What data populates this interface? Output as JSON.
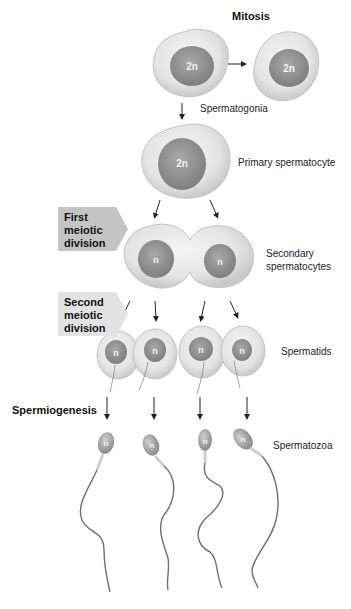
{
  "title": "Mitosis",
  "stages": {
    "spermatogonia": "Spermatogonia",
    "primary": "Primary spermatocyte",
    "secondary_line1": "Secondary",
    "secondary_line2": "spermatocytes",
    "spermatids": "Spermatids",
    "spermatozoa": "Spermatozoa"
  },
  "processes": {
    "first_meiotic": [
      "First",
      "meiotic",
      "division"
    ],
    "second_meiotic": [
      "Second",
      "meiotic",
      "division"
    ],
    "spermiogenesis": "Spermiogenesis"
  },
  "ploidy": {
    "diploid": "2n",
    "haploid": "n"
  },
  "colors": {
    "cell_fill": "#e6e6e6",
    "cell_edge": "#c8c8c8",
    "nucleus_fill": "#9a9a9a",
    "first_box": "#c4c4c4",
    "second_box": "#e2e2e2",
    "tail": "#6e6e6e"
  }
}
